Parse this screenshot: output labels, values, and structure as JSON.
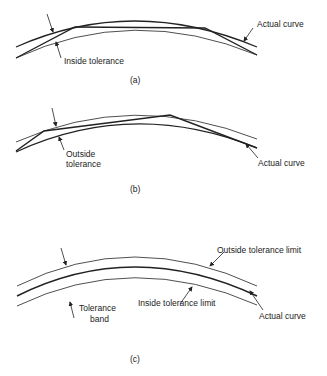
{
  "panels": [
    {
      "id": "a",
      "caption": "(a)",
      "labels": {
        "actual_curve": "Actual curve",
        "inside_tolerance": "Inside tolerance"
      }
    },
    {
      "id": "b",
      "caption": "(b)",
      "labels": {
        "actual_curve": "Actual curve",
        "outside_tolerance_line1": "Outside",
        "outside_tolerance_line2": "tolerance"
      }
    },
    {
      "id": "c",
      "caption": "(c)",
      "labels": {
        "outside_limit": "Outside tolerance limit",
        "inside_limit": "Inside tolerance limit",
        "actual_curve": "Actual curve",
        "band_line1": "Tolerance",
        "band_line2": "band"
      }
    }
  ],
  "colors": {
    "line": "#222222",
    "background": "#ffffff"
  }
}
